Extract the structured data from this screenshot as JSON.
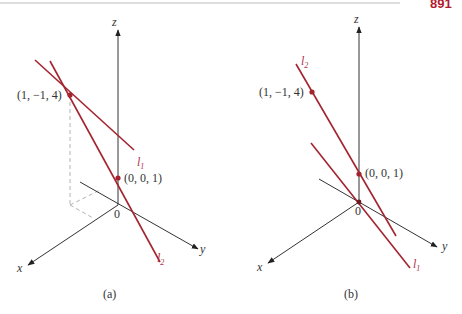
{
  "page": {
    "page_number_fragment": "891",
    "top_rule": true
  },
  "colors": {
    "line": "#a3242f",
    "axis": "#333333",
    "dashed": "#aaaaaa",
    "label_red": "#b0304a"
  },
  "figure_a": {
    "caption": "(a)",
    "axes": {
      "x": "x",
      "y": "y",
      "z": "z",
      "origin": "0"
    },
    "points": [
      {
        "label": "(1, −1, 4)"
      },
      {
        "label": "(0, 0, 1)"
      }
    ],
    "lines": [
      {
        "name": "l",
        "sub": "1"
      },
      {
        "name": "l",
        "sub": "2"
      }
    ]
  },
  "figure_b": {
    "caption": "(b)",
    "axes": {
      "x": "x",
      "y": "y",
      "z": "z",
      "origin": "0"
    },
    "points": [
      {
        "label": "(1, −1, 4)"
      },
      {
        "label": "(0, 0, 1)"
      }
    ],
    "lines": [
      {
        "name": "l",
        "sub": "2"
      },
      {
        "name": "l",
        "sub": "1"
      }
    ]
  }
}
